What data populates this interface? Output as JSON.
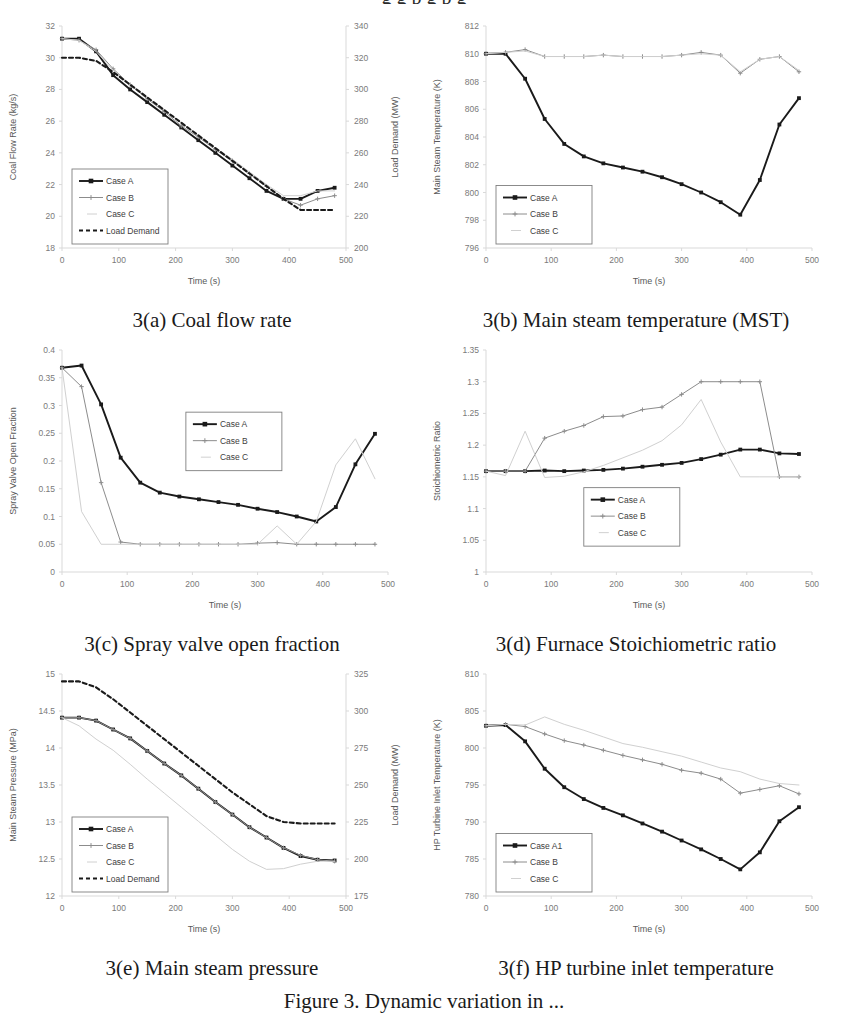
{
  "top_clipped_text": "g g p g p g",
  "figure_caption": "Figure 3. Dynamic variation in ...",
  "series_colors": {
    "case_a": "#1a1a1a",
    "case_b": "#8c8c8c",
    "case_c": "#d0d0d0",
    "load_demand": "#1a1a1a"
  },
  "axis_title_time": "Time (s)",
  "panels": [
    {
      "id": "3a",
      "caption": "3(a) Coal flow rate",
      "chart_data": {
        "type": "line",
        "title": "3(a) Coal flow rate",
        "xlabel": "Time (s)",
        "ylabel": "Coal Flow Rate (kg/s)",
        "y2label": "Load Demand (MW)",
        "xlim": [
          0,
          500
        ],
        "ylim": [
          18,
          32
        ],
        "y2lim": [
          200,
          340
        ],
        "xticks": [
          0,
          100,
          200,
          300,
          400,
          500
        ],
        "yticks": [
          18,
          20,
          22,
          24,
          26,
          28,
          30,
          32
        ],
        "y2ticks": [
          200,
          220,
          240,
          260,
          280,
          300,
          320,
          340
        ],
        "grid": false,
        "legend_position": "lower-left",
        "x": [
          0,
          30,
          60,
          90,
          120,
          150,
          180,
          210,
          240,
          270,
          300,
          330,
          360,
          390,
          420,
          450,
          480
        ],
        "series": [
          {
            "name": "Case A",
            "marker": true,
            "values": [
              31.2,
              31.2,
              30.4,
              28.9,
              28.0,
              27.2,
              26.4,
              25.6,
              24.8,
              24.0,
              23.2,
              22.4,
              21.6,
              21.1,
              21.1,
              21.6,
              21.8
            ]
          },
          {
            "name": "Case B",
            "marker": true,
            "values": [
              31.2,
              31.1,
              30.5,
              29.3,
              28.3,
              27.4,
              26.6,
              25.7,
              25.0,
              24.2,
              23.5,
              22.7,
              21.9,
              21.1,
              20.7,
              21.1,
              21.3
            ]
          },
          {
            "name": "Case C",
            "marker": false,
            "values": [
              31.2,
              31.1,
              30.4,
              29.2,
              28.3,
              27.5,
              26.7,
              25.9,
              25.1,
              24.3,
              23.6,
              22.8,
              22.0,
              21.3,
              21.3,
              21.6,
              21.6
            ]
          },
          {
            "name": "Load Demand",
            "marker": false,
            "dashed": true,
            "axis": "y2",
            "values": [
              320,
              320,
              318,
              311,
              303,
              295,
              287,
              279,
              271,
              263,
              255,
              247,
              239,
              231,
              224,
              224,
              224
            ]
          }
        ]
      }
    },
    {
      "id": "3b",
      "caption": "3(b) Main steam temperature (MST)",
      "chart_data": {
        "type": "line",
        "title": "3(b) Main steam temperature (MST)",
        "xlabel": "Time (s)",
        "ylabel": "Main Steam Temperature (K)",
        "xlim": [
          0,
          500
        ],
        "ylim": [
          796,
          812
        ],
        "xticks": [
          0,
          100,
          200,
          300,
          400,
          500
        ],
        "yticks": [
          796,
          798,
          800,
          802,
          804,
          806,
          808,
          810,
          812
        ],
        "grid": false,
        "legend_position": "lower-left",
        "x": [
          0,
          30,
          60,
          90,
          120,
          150,
          180,
          210,
          240,
          270,
          300,
          330,
          360,
          390,
          420,
          450,
          480
        ],
        "series": [
          {
            "name": "Case A",
            "marker": true,
            "values": [
              810.0,
              810.0,
              808.2,
              805.3,
              803.5,
              802.6,
              802.1,
              801.8,
              801.5,
              801.1,
              800.6,
              800.0,
              799.3,
              798.4,
              800.9,
              804.9,
              806.8
            ]
          },
          {
            "name": "Case B",
            "marker": true,
            "values": [
              810.0,
              810.1,
              810.3,
              809.8,
              809.8,
              809.8,
              809.9,
              809.8,
              809.8,
              809.8,
              809.9,
              810.1,
              809.9,
              808.6,
              809.6,
              809.8,
              808.7
            ]
          },
          {
            "name": "Case C",
            "marker": false,
            "values": [
              810.0,
              810.1,
              810.2,
              809.8,
              809.8,
              809.8,
              809.9,
              809.8,
              809.8,
              809.8,
              809.9,
              810.0,
              809.9,
              808.7,
              809.6,
              809.8,
              808.8
            ]
          }
        ]
      }
    },
    {
      "id": "3c",
      "caption": "3(c) Spray valve open fraction",
      "chart_data": {
        "type": "line",
        "title": "3(c) Spray valve open fraction",
        "xlabel": "Time (s)",
        "ylabel": "Spray Valve Open Fraction",
        "xlim": [
          0,
          500
        ],
        "ylim": [
          0,
          0.4
        ],
        "xticks": [
          0,
          100,
          200,
          300,
          400,
          500
        ],
        "yticks": [
          0,
          0.05,
          0.1,
          0.15,
          0.2,
          0.25,
          0.3,
          0.35,
          0.4
        ],
        "ytick_labels": [
          "0",
          "0.05",
          "0.1",
          "0.15",
          "0.2",
          "0.25",
          "0.3",
          "0.35",
          "0.4"
        ],
        "grid": false,
        "legend_position": "center",
        "x": [
          0,
          30,
          60,
          90,
          120,
          150,
          180,
          210,
          240,
          270,
          300,
          330,
          360,
          390,
          420,
          450,
          480
        ],
        "series": [
          {
            "name": "Case A",
            "marker": true,
            "values": [
              0.368,
              0.372,
              0.302,
              0.206,
              0.161,
              0.143,
              0.136,
              0.131,
              0.126,
              0.121,
              0.114,
              0.108,
              0.1,
              0.091,
              0.117,
              0.194,
              0.249
            ]
          },
          {
            "name": "Case B",
            "marker": true,
            "values": [
              0.368,
              0.334,
              0.161,
              0.054,
              0.05,
              0.05,
              0.05,
              0.05,
              0.05,
              0.05,
              0.052,
              0.053,
              0.05,
              0.05,
              0.05,
              0.05,
              0.05
            ]
          },
          {
            "name": "Case C",
            "marker": false,
            "values": [
              0.368,
              0.109,
              0.05,
              0.05,
              0.05,
              0.05,
              0.05,
              0.05,
              0.05,
              0.05,
              0.05,
              0.083,
              0.05,
              0.091,
              0.193,
              0.24,
              0.168
            ]
          }
        ]
      }
    },
    {
      "id": "3d",
      "caption": "3(d) Furnace Stoichiometric ratio",
      "chart_data": {
        "type": "line",
        "title": "3(d) Furnace Stoichiometric ratio",
        "xlabel": "Time (s)",
        "ylabel": "Stoichiometric Ratio",
        "xlim": [
          0,
          500
        ],
        "ylim": [
          1.0,
          1.35
        ],
        "xticks": [
          0,
          100,
          200,
          300,
          400,
          500
        ],
        "yticks": [
          1.0,
          1.05,
          1.1,
          1.15,
          1.2,
          1.25,
          1.3,
          1.35
        ],
        "ytick_labels": [
          "1",
          "1.05",
          "1.1",
          "1.15",
          "1.2",
          "1.25",
          "1.3",
          "1.35"
        ],
        "grid": false,
        "legend_position": "lower-center",
        "x": [
          0,
          30,
          60,
          90,
          120,
          150,
          180,
          210,
          240,
          270,
          300,
          330,
          360,
          390,
          420,
          450,
          480
        ],
        "series": [
          {
            "name": "Case A",
            "marker": true,
            "values": [
              1.159,
              1.159,
              1.159,
              1.16,
              1.159,
              1.16,
              1.161,
              1.163,
              1.166,
              1.169,
              1.172,
              1.178,
              1.185,
              1.193,
              1.193,
              1.187,
              1.186
            ]
          },
          {
            "name": "Case B",
            "marker": true,
            "values": [
              1.159,
              1.159,
              1.159,
              1.211,
              1.222,
              1.231,
              1.245,
              1.246,
              1.256,
              1.26,
              1.28,
              1.3,
              1.3,
              1.3,
              1.3,
              1.15,
              1.15
            ]
          },
          {
            "name": "Case C",
            "marker": false,
            "values": [
              1.159,
              1.152,
              1.222,
              1.149,
              1.151,
              1.158,
              1.168,
              1.18,
              1.192,
              1.207,
              1.232,
              1.272,
              1.205,
              1.15,
              1.15,
              1.15,
              1.15
            ]
          }
        ]
      }
    },
    {
      "id": "3e",
      "caption": "3(e) Main steam pressure",
      "chart_data": {
        "type": "line",
        "title": "3(e) Main steam pressure",
        "xlabel": "Time (s)",
        "ylabel": "Main Steam Pressure (MPa)",
        "y2label": "Load Demand (MW)",
        "xlim": [
          0,
          500
        ],
        "ylim": [
          12,
          15
        ],
        "y2lim": [
          175,
          325
        ],
        "xticks": [
          0,
          100,
          200,
          300,
          400,
          500
        ],
        "yticks": [
          12,
          12.5,
          13,
          13.5,
          14,
          14.5,
          15
        ],
        "ytick_labels": [
          "12",
          "12.5",
          "13",
          "13.5",
          "14",
          "14.5",
          "15"
        ],
        "y2ticks": [
          175,
          200,
          225,
          250,
          275,
          300,
          325
        ],
        "grid": false,
        "legend_position": "lower-left",
        "x": [
          0,
          30,
          60,
          90,
          120,
          150,
          180,
          210,
          240,
          270,
          300,
          330,
          360,
          390,
          420,
          450,
          480
        ],
        "series": [
          {
            "name": "Case A",
            "marker": true,
            "values": [
              14.41,
              14.41,
              14.37,
              14.25,
              14.13,
              13.96,
              13.79,
              13.63,
              13.45,
              13.27,
              13.1,
              12.93,
              12.79,
              12.65,
              12.54,
              12.49,
              12.48
            ]
          },
          {
            "name": "Case B",
            "marker": true,
            "values": [
              14.41,
              14.41,
              14.37,
              14.25,
              14.13,
              13.96,
              13.79,
              13.63,
              13.45,
              13.27,
              13.1,
              12.93,
              12.79,
              12.65,
              12.55,
              12.49,
              12.47
            ]
          },
          {
            "name": "Case C",
            "marker": false,
            "values": [
              14.41,
              14.3,
              14.12,
              13.97,
              13.78,
              13.58,
              13.39,
              13.2,
              13.01,
              12.82,
              12.63,
              12.47,
              12.36,
              12.37,
              12.43,
              12.47,
              12.47
            ]
          },
          {
            "name": "Load Demand",
            "marker": false,
            "dashed": true,
            "axis": "y2",
            "values": [
              320,
              320,
              316,
              308,
              299,
              290,
              281,
              272,
              263,
              254,
              245,
              237,
              229,
              225,
              224,
              224,
              224
            ]
          }
        ]
      }
    },
    {
      "id": "3f",
      "caption": "3(f) HP turbine inlet temperature",
      "chart_data": {
        "type": "line",
        "title": "3(f) HP turbine inlet temperature",
        "xlabel": "Time (s)",
        "ylabel": "HP Turbine Inlet Temperature (K)",
        "xlim": [
          0,
          500
        ],
        "ylim": [
          780,
          810
        ],
        "xticks": [
          0,
          100,
          200,
          300,
          400,
          500
        ],
        "yticks": [
          780,
          785,
          790,
          795,
          800,
          805,
          810
        ],
        "grid": false,
        "legend_position": "lower-left",
        "x": [
          0,
          30,
          60,
          90,
          120,
          150,
          180,
          210,
          240,
          270,
          300,
          330,
          360,
          390,
          420,
          450,
          480
        ],
        "series": [
          {
            "name": "Case A1",
            "marker": true,
            "values": [
              803.0,
              803.1,
              800.9,
              797.2,
              794.7,
              793.1,
              791.9,
              790.9,
              789.8,
              788.7,
              787.5,
              786.3,
              785.0,
              783.6,
              785.9,
              790.1,
              792.0
            ]
          },
          {
            "name": "Case B",
            "marker": true,
            "values": [
              803.0,
              803.2,
              802.9,
              801.9,
              801.0,
              800.4,
              799.7,
              799.0,
              798.4,
              797.8,
              797.0,
              796.6,
              795.8,
              793.9,
              794.4,
              794.9,
              793.8
            ]
          },
          {
            "name": "Case C",
            "marker": false,
            "values": [
              803.0,
              803.2,
              803.1,
              804.2,
              803.2,
              802.4,
              801.5,
              800.6,
              800.1,
              799.5,
              798.9,
              798.1,
              797.3,
              796.8,
              795.8,
              795.2,
              795.0
            ]
          }
        ]
      }
    }
  ]
}
